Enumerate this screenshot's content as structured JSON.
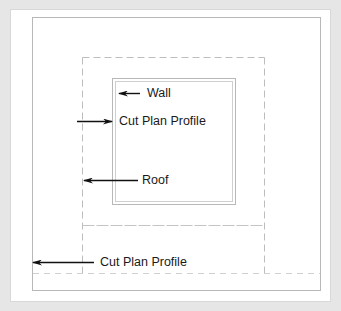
{
  "diagram": {
    "colors": {
      "background": "#e6e6e6",
      "panel": "#ffffff",
      "outline": "#b5b5b5",
      "dashed": "#bcbcbc",
      "arrow": "#111111",
      "text": "#1a1a1a"
    },
    "labels": {
      "wall": "Wall",
      "cut_plan_profile_inner": "Cut Plan Profile",
      "roof": "Roof",
      "cut_plan_profile_outer": "Cut Plan Profile"
    }
  }
}
